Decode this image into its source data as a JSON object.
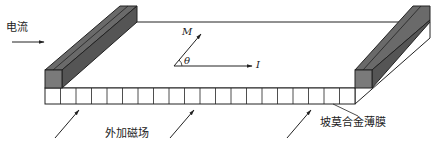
{
  "figure": {
    "labels": {
      "current": "电流",
      "external_field": "外加磁场",
      "film": "坡莫合金薄膜",
      "magnetization": "M",
      "angle": "θ",
      "current_vector": "I"
    },
    "film": {
      "cells": 20
    },
    "colors": {
      "line": "#222222",
      "electrode_top": "#6a6a6a",
      "electrode_front": "#7a7a7a",
      "electrode_side": "#5a5a5a",
      "film_face": "#ffffff"
    }
  }
}
